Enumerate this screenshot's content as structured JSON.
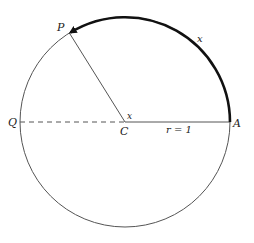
{
  "diagram": {
    "type": "unit-circle-arc",
    "colors": {
      "background": "#ffffff",
      "circle": "#555555",
      "arc": "#111111",
      "radius": "#555555",
      "text": "#222222"
    },
    "geometry": {
      "center": [
        125,
        122
      ],
      "radius": 105,
      "point_P_angle_deg": 122
    },
    "labels": {
      "P": "P",
      "Q": "Q",
      "C": "C",
      "A": "A",
      "arc_length": "x",
      "angle": "x",
      "radius": "r = 1"
    }
  }
}
